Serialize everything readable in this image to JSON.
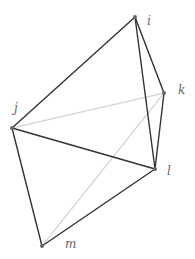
{
  "diagram": {
    "type": "graph",
    "vertices": [
      {
        "id": "i",
        "label": "i",
        "x": 135,
        "y": 17,
        "lx": 147,
        "ly": 25
      },
      {
        "id": "k",
        "label": "k",
        "x": 164,
        "y": 93,
        "lx": 178,
        "ly": 94
      },
      {
        "id": "j",
        "label": "j",
        "x": 12,
        "y": 128,
        "lx": 14,
        "ly": 112
      },
      {
        "id": "l",
        "label": "l",
        "x": 155,
        "y": 169,
        "lx": 167,
        "ly": 175
      },
      {
        "id": "m",
        "label": "m",
        "x": 42,
        "y": 246,
        "lx": 65,
        "ly": 248
      }
    ],
    "edges_dark": [
      [
        "i",
        "j"
      ],
      [
        "i",
        "l"
      ],
      [
        "i",
        "k"
      ],
      [
        "k",
        "l"
      ],
      [
        "j",
        "l"
      ],
      [
        "j",
        "m"
      ],
      [
        "m",
        "l"
      ]
    ],
    "edges_light": [
      [
        "j",
        "k"
      ],
      [
        "m",
        "k"
      ]
    ],
    "colors": {
      "dark": "#333333",
      "light": "#d8d8d8",
      "vertex": "#666666",
      "label": "#666666"
    }
  }
}
